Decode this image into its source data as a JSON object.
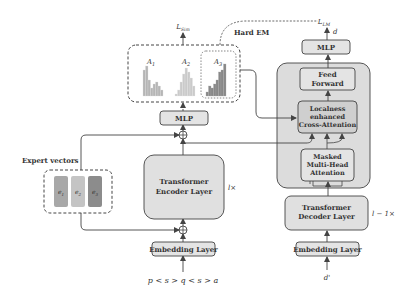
{
  "diagram": {
    "encoder": {
      "title_line1": "Transformer",
      "title_line2": "Encoder Layer",
      "repeat_label": "l×",
      "embedding_label": "Embedding Layer",
      "input_sequence": "p < s > q < s > a",
      "mlp_label": "MLP",
      "loss_label": "L",
      "loss_sub": "Sim",
      "hard_em_label": "Hard EM"
    },
    "attention_maps": {
      "items": [
        {
          "label": "A",
          "sub": "1",
          "color": "#b8b8b8",
          "bars": [
            26,
            30,
            16,
            8,
            12,
            14,
            10,
            6
          ]
        },
        {
          "label": "A",
          "sub": "2",
          "color": "#c8c8c8",
          "bars": [
            2,
            6,
            14,
            22,
            28,
            24,
            18,
            10
          ]
        },
        {
          "label": "A",
          "sub": "3",
          "color": "#8a8a8a",
          "bars": [
            4,
            10,
            8,
            12,
            16,
            24,
            26,
            32
          ]
        }
      ]
    },
    "expert_vectors": {
      "title": "Expert vectors",
      "items": [
        {
          "label": "e",
          "sub": "1",
          "color": "#a8a8a8"
        },
        {
          "label": "e",
          "sub": "2",
          "color": "#c4c4c4"
        },
        {
          "label": "e",
          "sub": "3",
          "color": "#8c8c8c"
        }
      ]
    },
    "decoder": {
      "feed_forward_line1": "Feed",
      "feed_forward_line2": "Forward",
      "cross_attn_line1": "Localness",
      "cross_attn_line2": "enhanced",
      "cross_attn_line3": "Cross-Attention",
      "masked_line1": "Masked",
      "masked_line2": "Multi-Head",
      "masked_line3": "Attention",
      "decoder_layer_line1": "Transformer",
      "decoder_layer_line2": "Decoder Layer",
      "repeat_label": "l − 1×",
      "embedding_label": "Embedding Layer",
      "input_label": "d'",
      "mlp_label": "MLP",
      "output_label": "d",
      "loss_label": "L",
      "loss_sub": "LM"
    },
    "colors": {
      "box_fill": "#e4e4e4",
      "box_stroke": "#444444",
      "big_box_fill": "#dcdcdc",
      "cross_attn_fill": "#cfcfcf",
      "line": "#444444"
    }
  }
}
